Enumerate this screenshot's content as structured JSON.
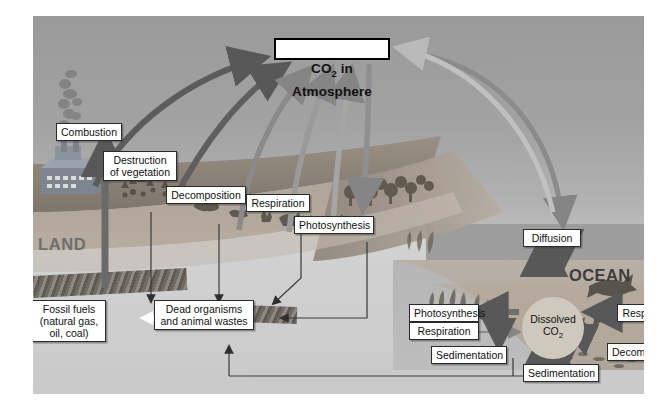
{
  "diagram": {
    "title_box": "CO2 in Atmosphere",
    "title_main": "CO",
    "title_sub": "2",
    "title_rest": " in Atmosphere",
    "region_land": "LAND",
    "region_ocean": "OCEAN"
  },
  "land_labels": {
    "combustion": "Combustion",
    "destruction": "Destruction\nof vegetation",
    "decomposition": "Decomposition",
    "respiration": "Respiration",
    "photosynthesis": "Photosynthesis",
    "fossil_fuels": "Fossil fuels\n(natural gas,\noil, coal)",
    "dead_organisms": "Dead organisms\nand animal wastes"
  },
  "ocean_labels": {
    "diffusion": "Diffusion",
    "photosynthesis": "Photosynthesis",
    "respiration_left": "Respiration",
    "respiration_right": "Respiration",
    "decomposition": "Decomposition",
    "sedimentation_left": "Sedimentation",
    "sedimentation_right": "Sedimentation",
    "dissolved_main": "Dissolved",
    "dissolved_co2": "CO",
    "dissolved_sub": "2"
  },
  "colors": {
    "sky_top": "#9a9a9a",
    "sky_bottom": "#cfcfcf",
    "ocean": "#b5b5b5",
    "arrow_dark": "#5a5a5a",
    "arrow_mid": "#7d7d7d",
    "arrow_light": "#bcbcbc",
    "land_band": "#8c8379",
    "dissolved_circle": "#cfc9bd",
    "land_text": "#6f6f6f",
    "ocean_text": "#3c3c3c",
    "box_border": "#2a2a2a",
    "box_fill": "#ffffff"
  }
}
